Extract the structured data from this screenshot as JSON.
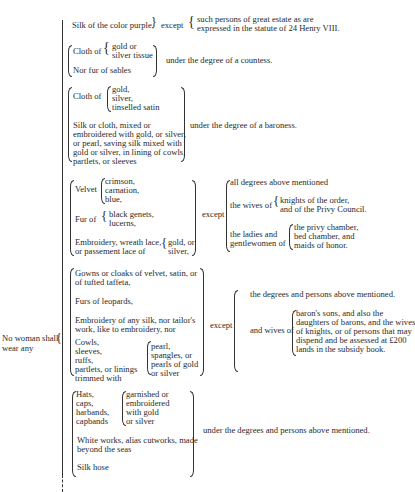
{
  "subject": {
    "line1": "No woman shall",
    "line2": "wear any"
  },
  "g1": {
    "item": "Silk of the color purple,",
    "except": "except",
    "exc1": "such persons of great estate as are",
    "exc2": "expressed in the statute of 24 Henry VIII."
  },
  "g2": {
    "cloth": "Cloth of",
    "c1": "gold or",
    "c2": "silver tissue",
    "fur": "Nor fur of sables",
    "result": "under the degree of a countess."
  },
  "g3": {
    "cloth": "Cloth of",
    "c1": "gold,",
    "c2": "silver,",
    "c3": "tinselled satin",
    "s1": "Silk or cloth, mixed or",
    "s2": "embroidered with gold, or silver,",
    "s3": "or pearl, saving silk mixed with",
    "s4": "gold or silver, in lining of cowls,",
    "s5": "partlets, or sleeves",
    "result": "under the degree of a baroness."
  },
  "g4": {
    "velvet": "Velvet",
    "v1": "crimson,",
    "v2": "carnation,",
    "v3": "blue,",
    "fur": "Fur of",
    "f1": "black genets,",
    "f2": "lucerns,",
    "e1": "Embroidery, wreath lace,",
    "e2": "or passement lace of",
    "g1": "gold, or",
    "g2": "silver,",
    "except": "except",
    "x1": "all degrees above mentioned",
    "wives": "the wives of",
    "w1": "knights of the order,",
    "w2": "and of the Privy Council.",
    "ladies1": "the ladies and",
    "ladies2": "gentlewomen of",
    "l1": "the privy chamber,",
    "l2": "bed chamber, and",
    "l3": "maids of honor."
  },
  "g5": {
    "gowns1": "Gowns or cloaks of velvet, satin, or",
    "gowns2": "of tufted taffeta,",
    "furs": "Furs of leopards,",
    "emb1": "Embroidery of any silk, nor tailor's",
    "emb2": "work, like to embroidery, nor",
    "c1": "Cowls,",
    "c2": "sleeves,",
    "c3": "ruffs,",
    "c4": "partlets, or linings",
    "c5": "trimmed with",
    "p1": "pearl,",
    "p2": "spangles, or",
    "p3": "pearls of gold",
    "p4": "or silver",
    "except": "except",
    "x1": "the degrees and persons above mentioned.",
    "wives": "and wives of",
    "b1": "baron's sons, and also the",
    "b2": "daughters of barons, and the wives",
    "b3": "of knights, or of persons that may",
    "b4": "dispend and be assessed at £200",
    "b5": "lands in the subsidy book."
  },
  "g6": {
    "h1": "Hats,",
    "h2": "caps,",
    "h3": "harbands,",
    "h4": "capbands",
    "g1": "garnished or",
    "g2": "embroidered",
    "g3": "with gold",
    "g4": "or silver",
    "w1": "White works, alias cutworks, made",
    "w2": "beyond the seas",
    "silk": "Silk hose",
    "result": "under the degrees and persons above mentioned."
  }
}
